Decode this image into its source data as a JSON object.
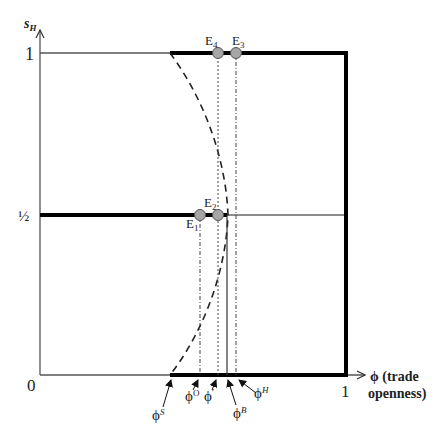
{
  "axes": {
    "y_label": "s",
    "y_label_sub": "H",
    "x_label_line1": "ϕ (trade",
    "x_label_line2": "openness)",
    "origin": "0",
    "x_tick_1": "1",
    "y_tick_1": "1",
    "y_tick_half": "½"
  },
  "equilibria": [
    {
      "label": "E",
      "sub": "1"
    },
    {
      "label": "E",
      "sub": "2"
    },
    {
      "label": "E",
      "sub": "3"
    },
    {
      "label": "E",
      "sub": "4"
    }
  ],
  "thresholds": [
    {
      "label": "ϕ",
      "sup": "S"
    },
    {
      "label": "ϕ",
      "sup": "O"
    },
    {
      "label": "ϕ",
      "sup": "′"
    },
    {
      "label": "ϕ",
      "sup": "B"
    },
    {
      "label": "ϕ",
      "sup": "H"
    }
  ],
  "colors": {
    "line": "#000000",
    "thin_line": "#555555",
    "point_fill": "#a6a6a6",
    "point_stroke": "#555555"
  }
}
